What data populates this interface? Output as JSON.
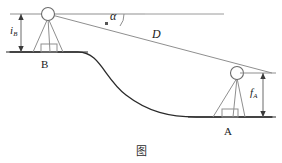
{
  "figure": {
    "caption": "图",
    "type": "surveying-trigonometric-leveling-diagram",
    "colors": {
      "ground_line": "#2b2b2b",
      "terrain_curve": "#2b2b2b",
      "construction_line": "#8f8f8f",
      "sight_line": "#8f8f8f",
      "dimension_line": "#6b6b6b",
      "text": "#1a1a1a",
      "background": "#ffffff"
    }
  },
  "labels": {
    "instrument_height_b": {
      "symbol": "i",
      "subscript": "B",
      "full": "iB"
    },
    "target_height_a": {
      "symbol": "f",
      "subscript": "A",
      "full": "fA"
    },
    "vertical_angle": {
      "symbol": "α",
      "full": "α"
    },
    "slope_distance": {
      "symbol": "D",
      "full": "D"
    },
    "station_b": "B",
    "station_a": "A"
  },
  "stations": {
    "b": {
      "name": "B",
      "role": "instrument-station",
      "instrument_x": 48,
      "instrument_y": 14,
      "ground_y": 52,
      "height_label": "iB"
    },
    "a": {
      "name": "A",
      "role": "target-station",
      "target_x": 237,
      "target_y": 73,
      "ground_y": 117,
      "height_label": "fA"
    }
  },
  "geometry": {
    "horizontal_reference_line": {
      "x1": 10,
      "y1": 14,
      "x2": 145,
      "y2": 14
    },
    "sight_line": {
      "x1": 48,
      "y1": 14,
      "x2": 272,
      "y2": 73
    },
    "angle_arc_label": "α",
    "distance_label": "D"
  }
}
